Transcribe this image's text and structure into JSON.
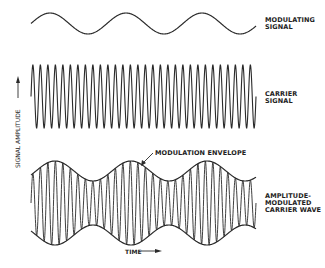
{
  "diagram": {
    "labels": {
      "modulating": "MODULATING\nSIGNAL",
      "modulating_line1": "MODULATING",
      "modulating_line2": "SIGNAL",
      "carrier_line1": "CARRIER",
      "carrier_line2": "SIGNAL",
      "am_line1": "AMPLITUDE-",
      "am_line2": "MODULATED",
      "am_line3": "CARRIER WAVE",
      "envelope": "MODULATION ENVELOPE",
      "y_axis": "SIGNAL AMPLITUDE",
      "x_axis": "TIME"
    },
    "colors": {
      "stroke": "#2a2a2a",
      "background": "#ffffff"
    },
    "waves": {
      "x_start": 31,
      "x_end": 256,
      "modulating": {
        "center_y": 23.5,
        "amplitude": 10.5,
        "period": 76,
        "cycles": 3
      },
      "carrier": {
        "center_y": 96.5,
        "amplitude": 31.5,
        "cycles": 30
      },
      "am": {
        "center_y": 203,
        "max_half_height": 42,
        "min_half_height": 22,
        "envelope_period": 76,
        "carrier_cycles": 30
      }
    }
  }
}
